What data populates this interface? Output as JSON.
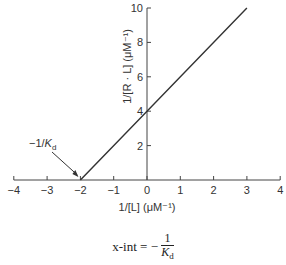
{
  "chart_data": {
    "type": "line",
    "title": "",
    "xlabel": "1/[L] (μM⁻¹)",
    "ylabel": "1/[R · L] (μM⁻¹)",
    "xlim": [
      -4,
      4
    ],
    "ylim": [
      0,
      10
    ],
    "x_ticks": [
      "−4",
      "−3",
      "−2",
      "−1",
      "0",
      "1",
      "2",
      "3",
      "4"
    ],
    "y_ticks": [
      "2",
      "4",
      "6",
      "8",
      "10"
    ],
    "grid": false,
    "series": [
      {
        "name": "Double-reciprocal plot",
        "x": [
          -2,
          0,
          3
        ],
        "y": [
          0,
          4,
          10
        ]
      }
    ],
    "annotations": [
      {
        "text": "−1/K",
        "subscript": "d",
        "points_to": [
          -2,
          0
        ]
      }
    ]
  },
  "formula": {
    "lhs": "x-int = −",
    "numerator": "1",
    "denominator": "K",
    "denominator_sub": "d"
  }
}
